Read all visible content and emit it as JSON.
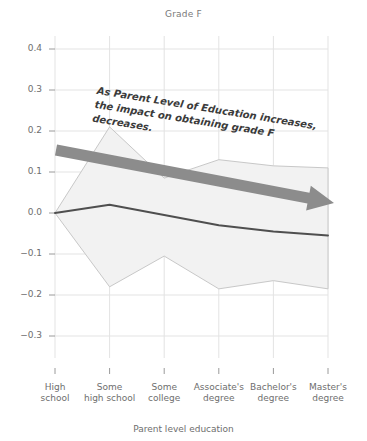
{
  "chart": {
    "title": "Grade F",
    "xlabel": "Parent level education",
    "annotation_line1": "As Parent Level of Education increases,",
    "annotation_line2": "the impact on obtaining grade F decreases.",
    "arrow_name": "trend-arrow",
    "colors": {
      "line": "#4f4f4f",
      "band_fill": "#f2f2f2",
      "band_stroke": "#c8c8c8",
      "grid": "#e3e3e3",
      "arrow": "#8c8c8c",
      "tick_text": "#6e6e6e",
      "title_text": "#7a7a7a",
      "annotation_text": "#3b3b3b"
    }
  },
  "chart_data": {
    "type": "line",
    "title": "Grade F",
    "xlabel": "Parent level education",
    "ylabel": "",
    "grid": true,
    "legend": "none",
    "ylim": [
      -0.35,
      0.44
    ],
    "yticks": [
      "0.4",
      "0.3",
      "0.2",
      "0.1",
      "0.0",
      "-0.1",
      "-0.2",
      "-0.3"
    ],
    "ytick_values": [
      0.4,
      0.3,
      0.2,
      0.1,
      0.0,
      -0.1,
      -0.2,
      -0.3
    ],
    "categories": [
      "High school",
      "Some high school",
      "Some college",
      "Associate's degree",
      "Bachelor's degree",
      "Master's degree"
    ],
    "category_lines": [
      [
        "High",
        "school"
      ],
      [
        "Some",
        "high school"
      ],
      [
        "Some",
        "college"
      ],
      [
        "Associate's",
        "degree"
      ],
      [
        "Bachelor's",
        "degree"
      ],
      [
        "Master's",
        "degree"
      ]
    ],
    "series": [
      {
        "name": "estimate",
        "values": [
          0.0,
          0.02,
          -0.005,
          -0.03,
          -0.045,
          -0.055
        ]
      },
      {
        "name": "upper_ci",
        "values": [
          0.0,
          0.21,
          0.085,
          0.13,
          0.115,
          0.11
        ]
      },
      {
        "name": "lower_ci",
        "values": [
          0.0,
          -0.18,
          -0.105,
          -0.185,
          -0.165,
          -0.185
        ]
      }
    ],
    "annotations": [
      {
        "text": "As Parent Level of Education increases, the impact on obtaining grade F decreases.",
        "rotation_deg": 9.2
      }
    ]
  }
}
